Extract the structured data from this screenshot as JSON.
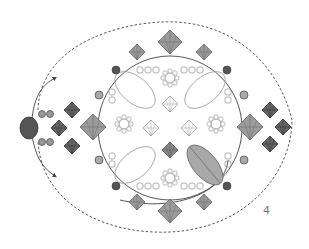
{
  "diagram": {
    "type": "beadwork-instruction",
    "step_number": "4",
    "colors": {
      "outline": "#9a9a9a",
      "thread": "#444444",
      "dashed_thread": "#444444",
      "crystal_fill": "#9c9c9c",
      "dark_bead_fill": "#555555",
      "rivoli_fill": "#a8a8a8",
      "background": "#ffffff"
    },
    "elements": {
      "center_components": [
        "navette-outline",
        "chaton-montee",
        "bicone-outline",
        "seed-bead-ring"
      ],
      "perimeter_components": [
        "bicone-crystal",
        "round-pearl",
        "seed-bead"
      ],
      "side_clusters": [
        "left-cluster",
        "right-cluster"
      ],
      "highlighted_navette": "bottom-right"
    }
  }
}
